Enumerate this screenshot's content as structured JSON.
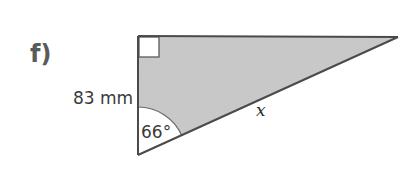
{
  "question": {
    "part_label": "f)"
  },
  "triangle": {
    "fill_color": "#c9c9c9",
    "stroke_color": "#4a4a4a",
    "vertices": {
      "right_angle": [
        138,
        36
      ],
      "top_right": [
        398,
        37
      ],
      "bottom": [
        138,
        155
      ]
    },
    "right_angle_marker": true,
    "side_labels": {
      "vertical_side": "83 mm",
      "hypotenuse": "x"
    },
    "angle_label": "66°"
  }
}
